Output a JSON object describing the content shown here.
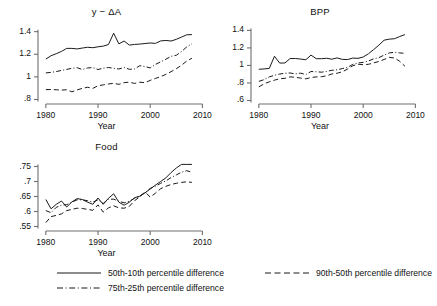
{
  "figure": {
    "axis_label": "Year",
    "line_color": "#1a1a1a",
    "axis_color": "#6e6e6e",
    "background": "#ffffff"
  },
  "legend": {
    "entries": [
      {
        "label": "50th-10th percentile difference",
        "style": "solid"
      },
      {
        "label": "90th-50th percentile difference",
        "style": "dashed"
      },
      {
        "label": "75th-25th percentile difference",
        "style": "dashdot"
      }
    ]
  },
  "chart_data": [
    {
      "type": "line",
      "title": "y − ΔA",
      "xlabel": "Year",
      "ylabel": "",
      "xlim": [
        1978.5,
        2010.5
      ],
      "ylim": [
        0.76,
        1.45
      ],
      "xticks": [
        1980,
        1990,
        2000,
        2010
      ],
      "xticklabels": [
        "1980",
        "1990",
        "2000",
        "2010"
      ],
      "yticks": [
        0.8,
        1.0,
        1.2,
        1.4
      ],
      "yticklabels": [
        ".8",
        "1",
        "1.2",
        "1.4"
      ],
      "grid": false,
      "legend_position": "below-figure",
      "x": [
        1980,
        1981,
        1982,
        1983,
        1984,
        1985,
        1986,
        1987,
        1988,
        1989,
        1990,
        1991,
        1992,
        1993,
        1994,
        1995,
        1996,
        1997,
        1998,
        1999,
        2000,
        2001,
        2002,
        2003,
        2004,
        2005,
        2006,
        2007,
        2008
      ],
      "series": [
        {
          "name": "50th-10th percentile difference",
          "style": "solid",
          "values": [
            1.157,
            1.187,
            1.205,
            1.225,
            1.252,
            1.252,
            1.247,
            1.255,
            1.262,
            1.258,
            1.266,
            1.272,
            1.286,
            1.386,
            1.292,
            1.317,
            1.281,
            1.287,
            1.29,
            1.295,
            1.3,
            1.296,
            1.318,
            1.322,
            1.317,
            1.332,
            1.352,
            1.372,
            1.374
          ]
        },
        {
          "name": "75th-25th percentile difference",
          "style": "dashdot",
          "values": [
            1.035,
            1.04,
            1.047,
            1.057,
            1.066,
            1.076,
            1.081,
            1.065,
            1.079,
            1.082,
            1.065,
            1.077,
            1.083,
            1.076,
            1.07,
            1.083,
            1.067,
            1.07,
            1.099,
            1.091,
            1.079,
            1.11,
            1.133,
            1.156,
            1.182,
            1.191,
            1.224,
            1.265,
            1.293
          ]
        },
        {
          "name": "90th-50th percentile difference",
          "style": "dashed",
          "values": [
            0.887,
            0.888,
            0.886,
            0.883,
            0.886,
            0.868,
            0.884,
            0.899,
            0.908,
            0.898,
            0.922,
            0.929,
            0.937,
            0.943,
            0.934,
            0.949,
            0.953,
            0.942,
            0.953,
            0.948,
            0.969,
            0.986,
            1.002,
            1.022,
            1.046,
            1.072,
            1.103,
            1.14,
            1.165
          ]
        }
      ]
    },
    {
      "type": "line",
      "title": "BPP",
      "xlabel": "Year",
      "ylabel": "",
      "xlim": [
        1978.5,
        2010.5
      ],
      "ylim": [
        0.56,
        1.45
      ],
      "xticks": [
        1980,
        1990,
        2000,
        2010
      ],
      "xticklabels": [
        "1980",
        "1990",
        "2000",
        "2010"
      ],
      "yticks": [
        0.6,
        0.8,
        1.0,
        1.2,
        1.4
      ],
      "yticklabels": [
        ".6",
        ".8",
        "1",
        "1.2",
        "1.4"
      ],
      "grid": false,
      "legend_position": "below-figure",
      "x": [
        1980,
        1981,
        1982,
        1983,
        1984,
        1985,
        1986,
        1987,
        1988,
        1989,
        1990,
        1991,
        1992,
        1993,
        1994,
        1995,
        1996,
        1997,
        1998,
        1999,
        2000,
        2001,
        2002,
        2003,
        2004,
        2005,
        2006,
        2007,
        2008
      ],
      "series": [
        {
          "name": "50th-10th percentile difference",
          "style": "solid",
          "values": [
            0.956,
            0.96,
            0.966,
            1.105,
            1.027,
            1.028,
            1.079,
            1.079,
            1.073,
            1.065,
            1.118,
            1.077,
            1.077,
            1.082,
            1.071,
            1.086,
            1.069,
            1.067,
            1.084,
            1.081,
            1.096,
            1.133,
            1.181,
            1.231,
            1.288,
            1.3,
            1.305,
            1.33,
            1.352
          ]
        },
        {
          "name": "75th-25th percentile difference",
          "style": "dashdot",
          "values": [
            0.818,
            0.838,
            0.869,
            0.888,
            0.902,
            0.911,
            0.914,
            0.903,
            0.912,
            0.896,
            0.931,
            0.928,
            0.923,
            0.932,
            0.945,
            0.95,
            0.964,
            0.977,
            1.012,
            1.028,
            1.035,
            1.051,
            1.075,
            1.089,
            1.118,
            1.143,
            1.15,
            1.143,
            1.138
          ]
        },
        {
          "name": "90th-50th percentile difference",
          "style": "dashed",
          "values": [
            0.755,
            0.79,
            0.813,
            0.832,
            0.848,
            0.853,
            0.87,
            0.864,
            0.856,
            0.847,
            0.862,
            0.869,
            0.871,
            0.882,
            0.903,
            0.911,
            0.928,
            0.958,
            0.996,
            1.014,
            1.008,
            1.013,
            1.029,
            1.045,
            1.068,
            1.092,
            1.085,
            1.047,
            0.99
          ]
        }
      ]
    },
    {
      "type": "line",
      "title": "Food",
      "xlabel": "Year",
      "ylabel": "",
      "xlim": [
        1978.5,
        2010.5
      ],
      "ylim": [
        0.535,
        0.775
      ],
      "xticks": [
        1980,
        1990,
        2000,
        2010
      ],
      "xticklabels": [
        "1980",
        "1990",
        "2000",
        "2010"
      ],
      "yticks": [
        0.55,
        0.6,
        0.65,
        0.7,
        0.75
      ],
      "yticklabels": [
        ".55",
        ".6",
        ".65",
        ".7",
        ".75"
      ],
      "grid": false,
      "legend_position": "below-figure",
      "x": [
        1980,
        1981,
        1982,
        1983,
        1984,
        1985,
        1986,
        1987,
        1988,
        1989,
        1990,
        1991,
        1992,
        1993,
        1994,
        1995,
        1996,
        1997,
        1998,
        1999,
        2000,
        2001,
        2002,
        2003,
        2004,
        2005,
        2006,
        2007,
        2008
      ],
      "series": [
        {
          "name": "50th-10th percentile difference",
          "style": "solid",
          "values": [
            0.64,
            0.609,
            0.624,
            0.635,
            0.615,
            0.632,
            0.643,
            0.64,
            0.631,
            0.624,
            0.645,
            0.624,
            0.644,
            0.659,
            0.631,
            0.621,
            0.631,
            0.646,
            0.651,
            0.662,
            0.675,
            0.688,
            0.7,
            0.712,
            0.73,
            0.745,
            0.757,
            0.757,
            0.757
          ]
        },
        {
          "name": "75th-25th percentile difference",
          "style": "dashdot",
          "values": [
            0.603,
            0.596,
            0.614,
            0.621,
            0.623,
            0.631,
            0.639,
            0.639,
            0.636,
            0.631,
            0.639,
            0.627,
            0.641,
            0.641,
            0.634,
            0.629,
            0.634,
            0.644,
            0.651,
            0.663,
            0.677,
            0.684,
            0.694,
            0.702,
            0.713,
            0.722,
            0.731,
            0.736,
            0.731
          ]
        },
        {
          "name": "90th-50th percentile difference",
          "style": "dashed",
          "values": [
            0.563,
            0.583,
            0.587,
            0.592,
            0.603,
            0.607,
            0.611,
            0.61,
            0.607,
            0.604,
            0.622,
            0.598,
            0.612,
            0.619,
            0.612,
            0.611,
            0.617,
            0.636,
            0.649,
            0.665,
            0.648,
            0.661,
            0.676,
            0.684,
            0.69,
            0.694,
            0.697,
            0.699,
            0.697
          ]
        }
      ]
    }
  ]
}
